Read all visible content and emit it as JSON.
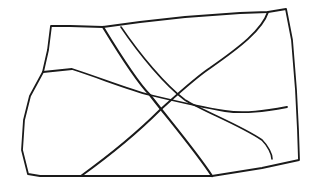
{
  "sketch": {
    "description": "Hand-drawn quadrilateral with four crossing lines",
    "ink_color": "#1a1a1a",
    "background_color": "#ffffff",
    "outline": {
      "points": "51,26 70,26 103,27 140,22 185,17 240,13 268,12 286,9 292,40 296,90 298,130 299,160 262,168 212,176 150,176 81,176 40,176 28,174 22,150 24,120 30,96 43,72 48,50 51,26",
      "stroke_width": 1.8
    },
    "lines": [
      {
        "name": "diagonal-line-thick",
        "d": "M103,27 C120,55 140,85 150,95 C165,115 195,150 212,176",
        "stroke_width": 2.2
      },
      {
        "name": "diagonal-line-thin",
        "d": "M121,27 C140,55 165,85 185,100 C205,112 240,125 262,140 C268,146 272,154 272,159",
        "stroke_width": 1.6
      },
      {
        "name": "rising-diagonal-line",
        "d": "M81,176 C110,155 140,130 160,110 C180,92 195,78 210,68 C240,47 262,30 268,12",
        "stroke_width": 2
      },
      {
        "name": "wavy-horizontal-line",
        "d": "M43,72 L72,69 C100,78 130,90 150,95 C175,101 200,107 225,111 C245,114 265,111 287,107",
        "stroke_width": 1.8
      }
    ]
  }
}
